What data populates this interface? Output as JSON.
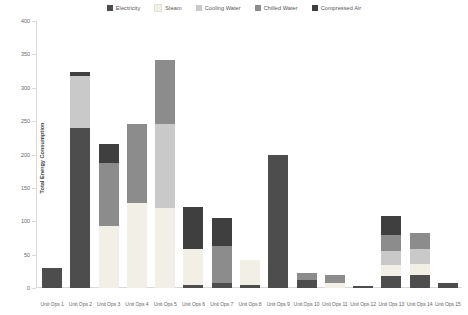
{
  "chart_data": {
    "type": "bar",
    "title": "",
    "subtitle": "",
    "xlabel": "",
    "ylabel": "Total Energy Consumption",
    "ylim": [
      0,
      400
    ],
    "yticks": [
      0,
      50,
      100,
      150,
      200,
      250,
      300,
      350,
      400
    ],
    "grid": false,
    "stacked": true,
    "legend_position": "top-center",
    "categories": [
      "Unit Ops 1",
      "Unit Ops 2",
      "Unit Ops 3",
      "Unit Ops 4",
      "Unit Ops 5",
      "Unit Ops 6",
      "Unit Ops 7",
      "Unit Ops 8",
      "Unit Ops 9",
      "Unit Ops 10",
      "Unit Ops 11",
      "Unit Ops 12",
      "Unit Ops 13",
      "Unit Ops 14",
      "Unit Ops 15"
    ],
    "series": [
      {
        "name": "Electricity",
        "color": "#4d4d4d",
        "values": [
          30,
          240,
          0,
          0,
          0,
          5,
          8,
          4,
          200,
          12,
          0,
          3,
          18,
          20,
          8
        ]
      },
      {
        "name": "Steam",
        "color": "#f2f0e6",
        "values": [
          0,
          0,
          93,
          128,
          120,
          53,
          0,
          38,
          0,
          0,
          8,
          0,
          16,
          16,
          0
        ]
      },
      {
        "name": "Cooling Water",
        "color": "#c9c9c9",
        "values": [
          0,
          78,
          0,
          0,
          125,
          0,
          0,
          0,
          0,
          0,
          0,
          0,
          22,
          22,
          0
        ]
      },
      {
        "name": "Chilled Water",
        "color": "#8c8c8c",
        "values": [
          0,
          0,
          95,
          118,
          97,
          0,
          55,
          0,
          0,
          10,
          12,
          0,
          24,
          25,
          0
        ]
      },
      {
        "name": "Compressed Air",
        "color": "#3f3f3f",
        "values": [
          0,
          5,
          28,
          0,
          0,
          64,
          42,
          0,
          0,
          0,
          0,
          0,
          28,
          0,
          0
        ]
      }
    ],
    "totals": [
      30,
      323,
      216,
      246,
      342,
      122,
      105,
      42,
      200,
      22,
      20,
      3,
      108,
      83,
      8
    ]
  },
  "legend": {
    "items": [
      {
        "label": "Electricity",
        "color": "#4d4d4d"
      },
      {
        "label": "Steam",
        "color": "#f2f0e6"
      },
      {
        "label": "Cooling Water",
        "color": "#c9c9c9"
      },
      {
        "label": "Chilled Water",
        "color": "#8c8c8c"
      },
      {
        "label": "Compressed Air",
        "color": "#3f3f3f"
      }
    ]
  },
  "axes": {
    "y_title": "Total Energy Consumption",
    "y_tick_labels": [
      "0",
      "50",
      "100",
      "150",
      "200",
      "250",
      "300",
      "350",
      "400"
    ]
  }
}
